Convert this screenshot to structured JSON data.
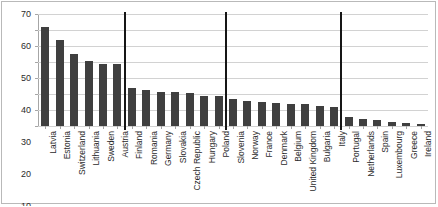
{
  "chart_data": {
    "type": "bar",
    "title": "",
    "subtitle": "",
    "xlabel": "",
    "ylabel": "",
    "ylim": [
      0,
      70
    ],
    "ytick_step": 10,
    "yticks": [
      0,
      10,
      20,
      30,
      40,
      50,
      60,
      70
    ],
    "grid": true,
    "legend": null,
    "legend_position": "none",
    "bar_color": "#3f3f3f",
    "separator_color": "#161616",
    "categories": [
      "Latvia",
      "Estonia",
      "Switzerland",
      "Lithuania",
      "Sweden",
      "Austria",
      "Finland",
      "Romania",
      "Germany",
      "Slovakia",
      "Czech Republic",
      "Hungary",
      "Poland",
      "Slovenia",
      "Norway",
      "France",
      "Denmark",
      "Belgium",
      "United Kingdom",
      "Bulgaria",
      "Italy",
      "Portugal",
      "Netherlands",
      "Spain",
      "Luxembourg",
      "Greece",
      "Ireland"
    ],
    "values": [
      62,
      54,
      45,
      40.5,
      39,
      38.5,
      24,
      22.8,
      21.5,
      21.3,
      20.5,
      19,
      19,
      17,
      15.5,
      15,
      14.5,
      14,
      13.5,
      12.5,
      12,
      5.5,
      4.5,
      4,
      2.5,
      1.8,
      1.2
    ],
    "separators_after": [
      "Austria",
      "Poland",
      "Italy"
    ]
  }
}
